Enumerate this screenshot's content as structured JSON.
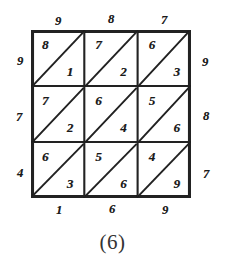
{
  "figure": {
    "caption": "(6)",
    "kind": "bordered-magic-square-diagram",
    "ink_color": "#1a1a1a",
    "paper_color": "#ffffff"
  },
  "grid": {
    "rows": 3,
    "cols": 3,
    "diagonal_direction": "bottom-left-to-top-right",
    "cells": [
      [
        {
          "upper": "8",
          "lower": "1"
        },
        {
          "upper": "7",
          "lower": "2"
        },
        {
          "upper": "6",
          "lower": "3"
        }
      ],
      [
        {
          "upper": "7",
          "lower": "2"
        },
        {
          "upper": "6",
          "lower": "4"
        },
        {
          "upper": "5",
          "lower": "6"
        }
      ],
      [
        {
          "upper": "6",
          "lower": "3"
        },
        {
          "upper": "5",
          "lower": "6"
        },
        {
          "upper": "4",
          "lower": "9"
        }
      ]
    ]
  },
  "edge_labels": {
    "top": [
      "9",
      "8",
      "7"
    ],
    "left": [
      "9",
      "7",
      "4"
    ],
    "right": [
      "9",
      "8",
      "7"
    ],
    "bottom": [
      "1",
      "6",
      "9"
    ]
  }
}
